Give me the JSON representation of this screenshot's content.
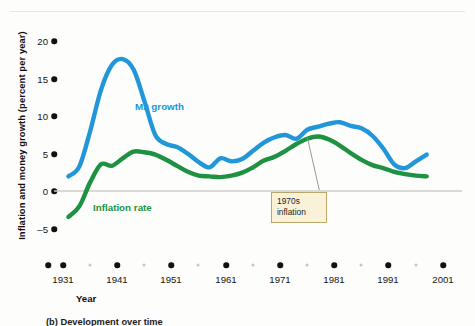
{
  "figure": {
    "y_axis_title": "Inflation and money growth (percent per year)",
    "x_axis_title": "Year",
    "caption": "(b) Development over time"
  },
  "annotations": [
    {
      "name": "1970s-inflation",
      "line1": "1970s",
      "line2": "inflation",
      "x": 1976,
      "y": 7.2
    }
  ],
  "series_labels": {
    "m2": "M2 growth",
    "inflation": "Inflation rate"
  },
  "colors": {
    "m2": "#2196d8",
    "inflation": "#1f9142",
    "axis_dot": "#111111",
    "minor_dot": "#c9c7c0",
    "zero_line": "#cfcdc6",
    "callout_bg": "#faf2d8",
    "callout_border": "#b9a86a"
  },
  "chart_data": {
    "type": "line",
    "title": "",
    "xlabel": "Year",
    "ylabel": "Inflation and money growth (percent per year)",
    "xlim": [
      1931,
      2001
    ],
    "ylim": [
      -5,
      20
    ],
    "yticks": [
      -5,
      0,
      5,
      10,
      15,
      20
    ],
    "ytick_labels": [
      "–5",
      "0",
      "5",
      "10",
      "15",
      "20"
    ],
    "xticks_major": [
      1931,
      1941,
      1951,
      1961,
      1971,
      1981,
      1991,
      2001
    ],
    "xticks_minor": [
      1936,
      1946,
      1956,
      1966,
      1976,
      1986,
      1996
    ],
    "grid": false,
    "zero_line": true,
    "legend": "inline-labels",
    "x": [
      1932,
      1934,
      1936,
      1938,
      1940,
      1942,
      1944,
      1946,
      1948,
      1950,
      1952,
      1954,
      1956,
      1958,
      1960,
      1962,
      1964,
      1966,
      1968,
      1970,
      1972,
      1974,
      1976,
      1978,
      1980,
      1982,
      1984,
      1986,
      1988,
      1990,
      1992,
      1994,
      1996,
      1998
    ],
    "series": [
      {
        "name": "M2 growth",
        "color": "#2196d8",
        "values": [
          2.0,
          3.3,
          8.0,
          13.5,
          16.8,
          17.6,
          16.2,
          12.0,
          7.5,
          6.3,
          5.9,
          5.0,
          3.9,
          3.2,
          4.4,
          4.0,
          4.3,
          5.4,
          6.5,
          7.2,
          7.5,
          7.0,
          8.2,
          8.6,
          9.0,
          9.2,
          8.7,
          8.4,
          7.4,
          5.7,
          3.6,
          3.1,
          4.0,
          4.9
        ]
      },
      {
        "name": "Inflation rate",
        "color": "#1f9142",
        "values": [
          -3.4,
          -2.0,
          1.2,
          3.6,
          3.4,
          4.4,
          5.3,
          5.2,
          4.9,
          4.2,
          3.4,
          2.6,
          2.1,
          2.0,
          1.9,
          2.1,
          2.5,
          3.2,
          4.1,
          4.6,
          5.4,
          6.3,
          7.0,
          7.3,
          6.9,
          6.1,
          5.1,
          4.2,
          3.5,
          3.1,
          2.6,
          2.3,
          2.1,
          2.0
        ]
      }
    ]
  }
}
